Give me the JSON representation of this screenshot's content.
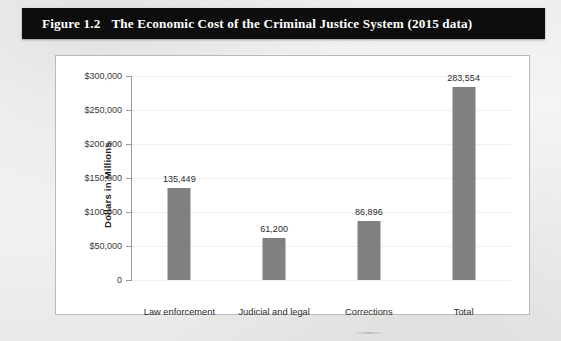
{
  "figure": {
    "number": "Figure 1.2",
    "title": "The Economic Cost of the Criminal Justice System (2015 data)"
  },
  "chart_data": {
    "type": "bar",
    "title": "The Economic Cost of the Criminal Justice System (2015 data)",
    "categories": [
      "Law enforcement",
      "Judicial and legal",
      "Corrections",
      "Total"
    ],
    "values": [
      135449,
      61200,
      86896,
      283554
    ],
    "value_labels": [
      "135,449",
      "61,200",
      "86,896",
      "283,554"
    ],
    "xlabel": "",
    "ylabel": "Dollars in Millions",
    "ylim": [
      0,
      300000
    ],
    "yticks": [
      0,
      50000,
      100000,
      150000,
      200000,
      250000,
      300000
    ],
    "ytick_labels": [
      "0",
      "$50,000",
      "$100,000",
      "$150,000",
      "$200,000",
      "$250,000",
      "$300,000"
    ],
    "grid": true,
    "legend": false,
    "bar_color": "#808080",
    "series": [
      {
        "name": "Cost",
        "values": [
          135449,
          61200,
          86896,
          283554
        ]
      }
    ]
  }
}
